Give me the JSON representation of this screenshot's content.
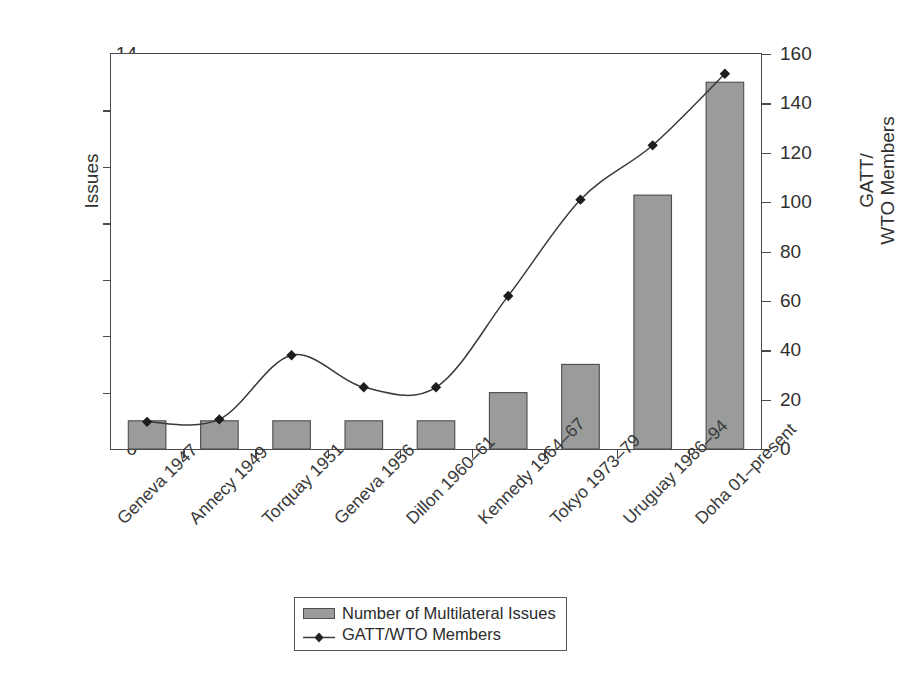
{
  "chart_data": {
    "type": "bar",
    "title": "",
    "categories": [
      "Geneva 1947",
      "Annecy 1949",
      "Torquay 1951",
      "Geneva 1956",
      "Dillon 1960–61",
      "Kennedy 1964–67",
      "Tokyo 1973–79",
      "Uruguay 1986–94",
      "Doha 01–present"
    ],
    "series": [
      {
        "name": "Number of Multilateral Issues",
        "type": "bar",
        "axis": "left",
        "values": [
          1,
          1,
          1,
          1,
          1,
          2,
          3,
          9,
          13
        ],
        "color": "#9a9b9b",
        "edge_color": "#4d4d4d"
      },
      {
        "name": "GATT/WTO Members",
        "type": "line",
        "axis": "right",
        "marker": "diamond",
        "values": [
          11,
          12,
          38,
          25,
          25,
          62,
          101,
          123,
          152
        ],
        "color": "#3a3a3a"
      }
    ],
    "xlabel": "",
    "ylabel": "Issues",
    "ylabel_right": "GATT/ WTO Members",
    "ylim": [
      0,
      14
    ],
    "ylim_right": [
      0,
      160
    ],
    "yticks": [
      0,
      2,
      4,
      6,
      8,
      10,
      12,
      14
    ],
    "yticks_right": [
      0,
      20,
      40,
      60,
      80,
      100,
      120,
      140,
      160
    ],
    "grid": false,
    "legend_position": "bottom-center"
  },
  "axes": {
    "left_title": "Issues",
    "right_title_line1": "GATT/",
    "right_title_line2": "WTO Members"
  },
  "legend": {
    "items": [
      {
        "label": "Number of Multilateral Issues",
        "marker": "bar-swatch"
      },
      {
        "label": "GATT/WTO Members",
        "marker": "line-diamond"
      }
    ]
  }
}
